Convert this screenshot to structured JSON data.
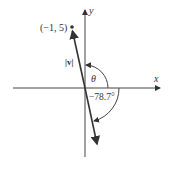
{
  "diagram": {
    "point_label": "(−1, 5)",
    "x_axis_label": "x",
    "y_axis_label": "y",
    "magnitude_label": "|v|",
    "theta_label": "θ",
    "angle_label": "−78.7°",
    "colors": {
      "line": "#333333",
      "axis": "#444444"
    }
  }
}
